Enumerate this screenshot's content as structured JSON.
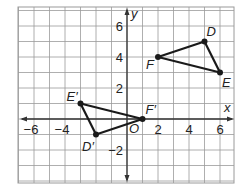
{
  "graph": {
    "axes": {
      "x_label": "x",
      "y_label": "y",
      "origin_label": "O",
      "x_ticks": [
        {
          "value": -6,
          "label": "−6"
        },
        {
          "value": -4,
          "label": "−4"
        },
        {
          "value": 2,
          "label": "2"
        },
        {
          "value": 4,
          "label": "4"
        },
        {
          "value": 6,
          "label": "6"
        }
      ],
      "y_ticks": [
        {
          "value": 6,
          "label": "6"
        },
        {
          "value": 4,
          "label": "4"
        },
        {
          "value": 2,
          "label": "2"
        },
        {
          "value": -2,
          "label": "−2"
        }
      ],
      "x_range": [
        -7,
        7
      ],
      "y_range": [
        -4,
        7
      ],
      "grid": true
    },
    "triangles": [
      {
        "name": "DEF",
        "vertices": [
          {
            "label": "D",
            "x": 5,
            "y": 5
          },
          {
            "label": "E",
            "x": 6,
            "y": 3
          },
          {
            "label": "F",
            "x": 2,
            "y": 4
          }
        ]
      },
      {
        "name": "D'E'F'",
        "vertices": [
          {
            "label": "D′",
            "x": -2,
            "y": -1
          },
          {
            "label": "E′",
            "x": -3,
            "y": 1
          },
          {
            "label": "F′",
            "x": 1,
            "y": 0
          }
        ]
      }
    ],
    "colors": {
      "grid": "#9a9a9a",
      "axis": "#333333",
      "shape": "#1a1a1a"
    }
  }
}
